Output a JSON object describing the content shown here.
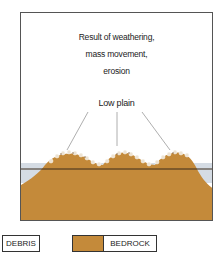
{
  "diagram": {
    "caption_lines": [
      "Result of weathering,",
      "mass movement,",
      "erosion"
    ],
    "feature_label": "Low plain",
    "colors": {
      "bedrock": "#C48A3A",
      "debris": "#EDE3D3",
      "sky_band": "#D5DCE4",
      "frame": "#555555",
      "horizon_line": "#3A2A1A",
      "pointer_line": "#999999"
    }
  },
  "legend": {
    "items": [
      {
        "label": "DEBRIS",
        "swatch": "none"
      },
      {
        "label": "BEDROCK",
        "swatch": "#C48A3A"
      }
    ]
  }
}
